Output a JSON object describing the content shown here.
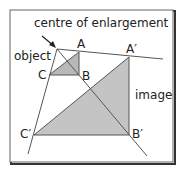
{
  "diagram": {
    "type": "enlargement",
    "labels": {
      "centre": "centre of enlargement",
      "object": "object",
      "image": "image",
      "A": "A",
      "B": "B",
      "C": "C",
      "A_prime": "A′",
      "B_prime": "B′",
      "C_prime": "C′"
    },
    "points": {
      "O": [
        57,
        49
      ],
      "A": [
        79,
        52
      ],
      "B": [
        79,
        75
      ],
      "C": [
        49,
        75
      ],
      "A_prime": [
        129,
        57
      ],
      "B_prime": [
        129,
        135
      ],
      "C_prime": [
        34,
        135
      ]
    },
    "colors": {
      "fill": "#c4c4c4",
      "line": "#555555",
      "frame": "#333333",
      "text": "#222222"
    }
  }
}
